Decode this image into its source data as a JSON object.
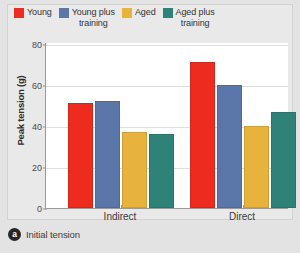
{
  "caption": {
    "badge": "a",
    "text": "Initial tension"
  },
  "legend": {
    "position": "top",
    "items": [
      {
        "label": "Young",
        "color": "#ED2B1F",
        "swatch_icon": "legend-swatch-icon"
      },
      {
        "label": "Young plus\ntraining",
        "color": "#5B76A8",
        "swatch_icon": "legend-swatch-icon"
      },
      {
        "label": "Aged",
        "color": "#E8B33C",
        "swatch_icon": "legend-swatch-icon"
      },
      {
        "label": "Aged plus\ntraining",
        "color": "#2E8278",
        "swatch_icon": "legend-swatch-icon"
      }
    ]
  },
  "chart_data": {
    "type": "bar",
    "title": "",
    "xlabel": "",
    "ylabel": "Peak tension (g)",
    "categories": [
      "Indirect",
      "Direct"
    ],
    "series": [
      {
        "name": "Young",
        "color": "#ED2B1F",
        "values": [
          51,
          71
        ]
      },
      {
        "name": "Young plus training",
        "color": "#5B76A8",
        "values": [
          52,
          60
        ]
      },
      {
        "name": "Aged",
        "color": "#E8B33C",
        "values": [
          37,
          40
        ]
      },
      {
        "name": "Aged plus training",
        "color": "#2E8278",
        "values": [
          36,
          47
        ]
      }
    ],
    "ylim": [
      0,
      80
    ],
    "yticks": [
      0,
      20,
      40,
      60,
      80
    ],
    "ytick_labels": [
      "0",
      "20",
      "40",
      "60",
      "80"
    ],
    "grid": true,
    "grid_axis": "y",
    "legend_position": "top"
  },
  "colors": {
    "figure_background": "#e3e3e3",
    "panel_background": "#e9e9e9",
    "plot_background": "#ffffff",
    "axis": "#9a9a9a",
    "gridline": "#dedede",
    "text": "#3a3a3a"
  }
}
